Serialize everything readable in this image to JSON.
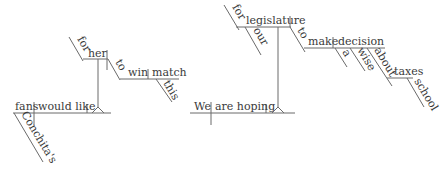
{
  "diagrams": [
    {
      "sentence_subject": "fans",
      "verb": "would like",
      "subject_modifier": "Conchita's",
      "infinitive_subject_prep": "for",
      "infinitive_subject": "her",
      "infinitive_marker": "to",
      "infinitive_verb": "win",
      "infinitive_object": "match",
      "object_modifier": "this"
    },
    {
      "sentence_subject": "We",
      "verb": "are hoping",
      "infinitive_subject_prep": "for",
      "infinitive_subject": "legislature",
      "subject_modifier": "our",
      "infinitive_marker": "to",
      "infinitive_verb": "make",
      "infinitive_object": "decision",
      "object_modifiers": [
        "a",
        "wise"
      ],
      "prep": "about",
      "prep_object": "taxes",
      "prep_object_modifier": "school"
    }
  ]
}
